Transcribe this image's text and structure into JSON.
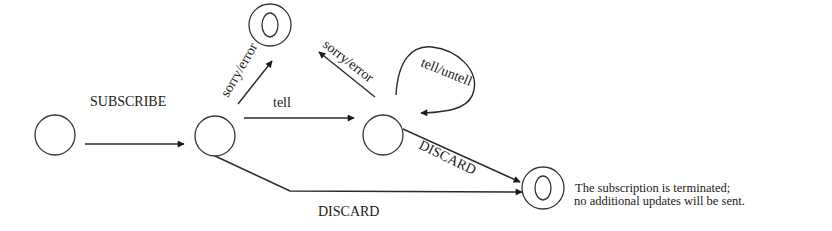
{
  "diagram": {
    "type": "state-machine",
    "states": [
      {
        "id": "s0",
        "kind": "initial-state",
        "cx": 55,
        "cy": 135
      },
      {
        "id": "s1",
        "kind": "state",
        "cx": 215,
        "cy": 136
      },
      {
        "id": "s_err",
        "kind": "final-state",
        "cx": 270,
        "cy": 25
      },
      {
        "id": "s2",
        "kind": "state",
        "cx": 383,
        "cy": 135
      },
      {
        "id": "s_term",
        "kind": "final-state",
        "cx": 543,
        "cy": 188
      }
    ],
    "transitions": [
      {
        "from": "s0",
        "to": "s1",
        "label": "SUBSCRIBE"
      },
      {
        "from": "s1",
        "to": "s_err",
        "label": "sorry/error"
      },
      {
        "from": "s1",
        "to": "s2",
        "label": "tell"
      },
      {
        "from": "s2",
        "to": "s_err",
        "label": "sorry/error"
      },
      {
        "from": "s2",
        "to": "s2",
        "label": "tell/untell"
      },
      {
        "from": "s2",
        "to": "s_term",
        "label": "DISCARD"
      },
      {
        "from": "s1",
        "to": "s_term",
        "label": "DISCARD"
      }
    ],
    "note": {
      "line1": "The subscription is terminated;",
      "line2": "no additional updates will be sent."
    }
  }
}
